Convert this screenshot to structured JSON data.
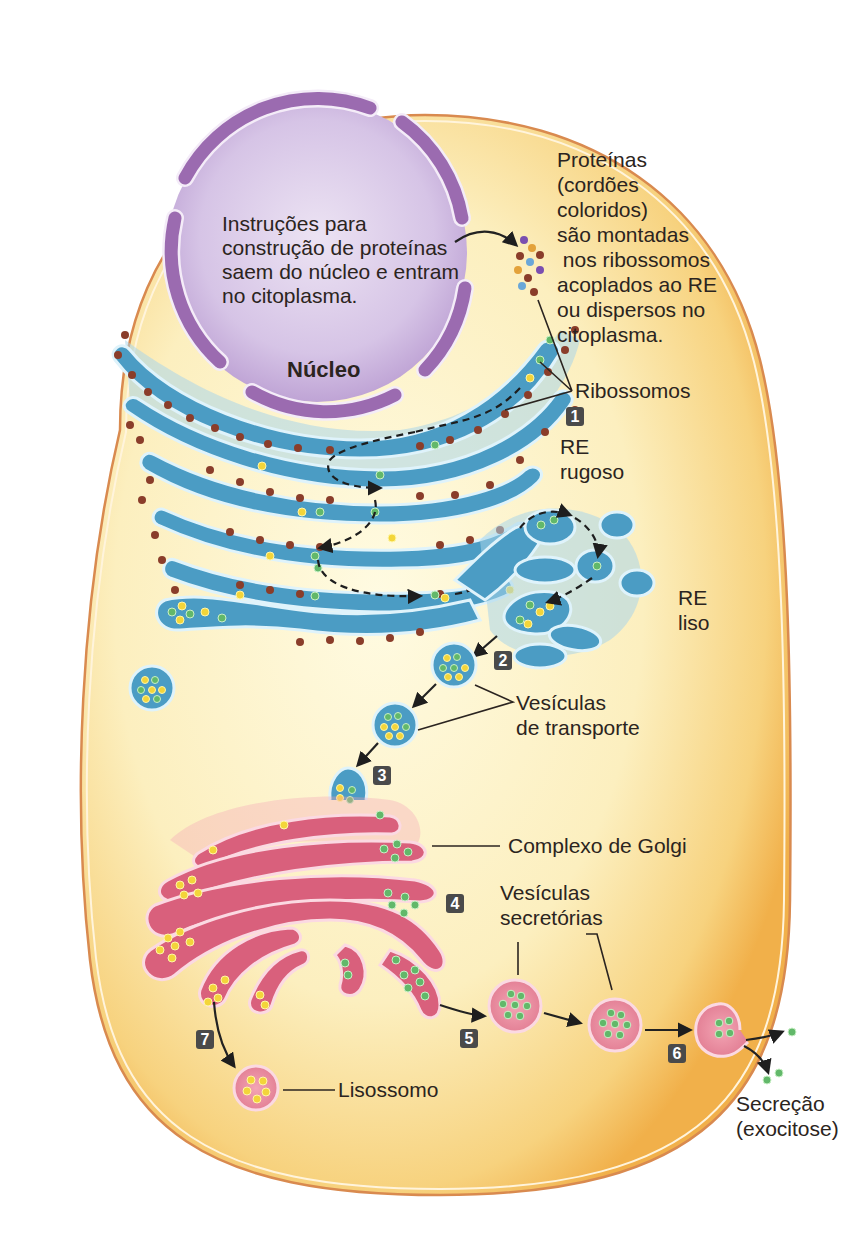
{
  "figure": {
    "colors": {
      "cytoplasm": "#fbe6a8",
      "cytoplasm_edge": "#f2b24a",
      "membrane": "#d98a4f",
      "nucleus": "#c9b3dc",
      "nuclear_envelope": "#9b6bb0",
      "er": "#4b9cc4",
      "golgi": "#d9607c",
      "ribosome": "#8a3d2a",
      "protein_yellow": "#f3d53a",
      "protein_green": "#62b86a",
      "badge": "#4a4a4a"
    },
    "labels": {
      "nucleus_text": [
        "Instruções para",
        "construção de proteínas",
        "saem do núcleo e entram",
        "no citoplasma."
      ],
      "nucleus_name": "Núcleo",
      "proteins_text": [
        "Proteínas",
        "(cordões",
        "coloridos)",
        "são montadas",
        " nos ribossomos",
        "acoplados ao RE",
        "ou dispersos no",
        "citoplasma."
      ],
      "ribosomes": "Ribossomos",
      "rough_er": [
        "RE",
        "rugoso"
      ],
      "smooth_er": [
        "RE",
        "liso"
      ],
      "transport_vesicles": [
        "Vesículas",
        "de transporte"
      ],
      "golgi": "Complexo de Golgi",
      "secretory_vesicles": [
        "Vesículas",
        "secretórias"
      ],
      "lysosome": "Lisossomo",
      "secretion": [
        "Secreção",
        "(exocitose)"
      ]
    },
    "step_badges": [
      "1",
      "2",
      "3",
      "4",
      "5",
      "6",
      "7"
    ]
  }
}
